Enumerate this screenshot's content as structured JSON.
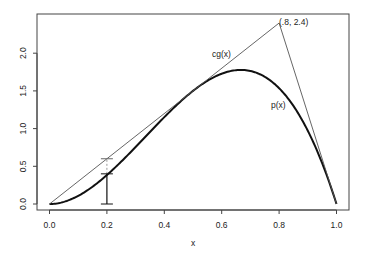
{
  "chart_data": {
    "type": "line",
    "title": "",
    "xlabel": "x",
    "ylabel": "",
    "xlim": [
      -0.04,
      1.04
    ],
    "ylim": [
      -0.08,
      2.53
    ],
    "grid": false,
    "x_ticks": [
      0.0,
      0.2,
      0.4,
      0.6,
      0.8,
      1.0
    ],
    "x_tick_labels": [
      "0.0",
      "0.2",
      "0.4",
      "0.6",
      "0.8",
      "1.0"
    ],
    "y_ticks": [
      0.0,
      0.5,
      1.0,
      1.5,
      2.0
    ],
    "y_tick_labels": [
      "0.0",
      "0.5",
      "1.0",
      "1.5",
      "2.0"
    ],
    "series": [
      {
        "name": "p(x)",
        "style": "thick",
        "description": "density 12x^2(1-x)",
        "x": [
          0,
          0.05,
          0.1,
          0.15,
          0.2,
          0.25,
          0.3,
          0.35,
          0.4,
          0.45,
          0.5,
          0.55,
          0.6,
          0.65,
          0.6667,
          0.7,
          0.75,
          0.8,
          0.85,
          0.9,
          0.95,
          1.0
        ],
        "values": [
          0,
          0.029,
          0.108,
          0.23,
          0.384,
          0.563,
          0.756,
          0.956,
          1.152,
          1.337,
          1.5,
          1.634,
          1.728,
          1.775,
          1.778,
          1.764,
          1.688,
          1.536,
          1.301,
          0.972,
          0.542,
          0
        ]
      },
      {
        "name": "cg(x)",
        "style": "thin",
        "description": "piecewise linear envelope",
        "x": [
          0,
          0.8,
          1.0
        ],
        "values": [
          0,
          2.4,
          0
        ]
      }
    ],
    "annotations": [
      {
        "text": "(.8, 2.4)",
        "x": 0.8,
        "y": 2.4
      },
      {
        "text": "cg(x)",
        "x": 0.55,
        "y": 1.95
      },
      {
        "text": "p(x)",
        "x": 0.8,
        "y": 1.25
      }
    ],
    "error_bar": {
      "x": 0.2,
      "low": 0.0,
      "mid": 0.4,
      "high": 0.6
    }
  },
  "labels": {
    "xlabel": "x",
    "peak_label": "(.8, 2.4)",
    "envelope_label": "cg(x)",
    "density_label": "p(x)"
  }
}
